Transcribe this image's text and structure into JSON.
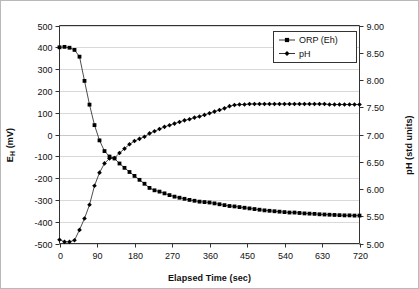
{
  "chart_data": {
    "type": "line",
    "title": "",
    "xlabel": "Elapsed Time (sec)",
    "ylabel": "EH (mV)",
    "y2label": "pH (std units)",
    "xlim": [
      0,
      720
    ],
    "ylim": [
      -500,
      500
    ],
    "y2lim": [
      5.0,
      9.0
    ],
    "xticks": [
      0,
      90,
      180,
      270,
      360,
      450,
      540,
      630,
      720
    ],
    "yticks": [
      -500,
      -400,
      -300,
      -200,
      -100,
      0,
      100,
      200,
      300,
      400,
      500
    ],
    "y2ticks": [
      5.0,
      5.5,
      6.0,
      6.5,
      7.0,
      7.5,
      8.0,
      8.5,
      9.0
    ],
    "xtick_labels": [
      "0",
      "90",
      "180",
      "270",
      "360",
      "450",
      "540",
      "630",
      "720"
    ],
    "ytick_labels": [
      "-500",
      "-400",
      "-300",
      "-200",
      "-100",
      "0",
      "100",
      "200",
      "300",
      "400",
      "500"
    ],
    "y2tick_labels": [
      "5.00",
      "5.50",
      "6.00",
      "6.50",
      "7.00",
      "7.50",
      "8.00",
      "8.50",
      "9.00"
    ],
    "grid": "horizontal-only",
    "legend_position": "top-right",
    "series": [
      {
        "name": "ORP (Eh)",
        "axis": "left",
        "marker": "square",
        "color": "#000000",
        "x": [
          0,
          12,
          24,
          36,
          48,
          60,
          72,
          84,
          96,
          108,
          120,
          132,
          144,
          156,
          168,
          180,
          192,
          204,
          216,
          228,
          240,
          252,
          264,
          276,
          288,
          300,
          312,
          324,
          336,
          348,
          360,
          372,
          384,
          396,
          408,
          420,
          432,
          444,
          456,
          468,
          480,
          492,
          504,
          516,
          528,
          540,
          552,
          564,
          576,
          588,
          600,
          612,
          624,
          636,
          648,
          660,
          672,
          684,
          696,
          708,
          720
        ],
        "values": [
          400,
          402,
          398,
          388,
          357,
          246,
          137,
          43,
          -27,
          -76,
          -101,
          -110,
          -133,
          -153,
          -172,
          -190,
          -208,
          -226,
          -245,
          -256,
          -262,
          -270,
          -278,
          -285,
          -290,
          -295,
          -300,
          -304,
          -308,
          -310,
          -312,
          -316,
          -320,
          -324,
          -328,
          -330,
          -333,
          -336,
          -339,
          -342,
          -345,
          -348,
          -350,
          -352,
          -354,
          -356,
          -358,
          -358,
          -360,
          -362,
          -363,
          -364,
          -366,
          -367,
          -368,
          -369,
          -370,
          -371,
          -371,
          -372,
          -372
        ]
      },
      {
        "name": "pH",
        "axis": "right",
        "marker": "diamond",
        "color": "#000000",
        "x": [
          0,
          12,
          24,
          36,
          48,
          60,
          72,
          84,
          96,
          108,
          120,
          132,
          144,
          156,
          168,
          180,
          192,
          204,
          216,
          228,
          240,
          252,
          264,
          276,
          288,
          300,
          312,
          324,
          336,
          348,
          360,
          372,
          384,
          396,
          408,
          420,
          432,
          444,
          456,
          468,
          480,
          492,
          504,
          516,
          528,
          540,
          552,
          564,
          576,
          588,
          600,
          612,
          624,
          636,
          648,
          660,
          672,
          684,
          696,
          708,
          720
        ],
        "values": [
          5.07,
          5.03,
          5.03,
          5.06,
          5.25,
          5.46,
          5.71,
          6.06,
          6.3,
          6.47,
          6.56,
          6.57,
          6.66,
          6.74,
          6.82,
          6.88,
          6.92,
          6.96,
          7.02,
          7.06,
          7.1,
          7.14,
          7.17,
          7.2,
          7.23,
          7.26,
          7.28,
          7.31,
          7.33,
          7.36,
          7.39,
          7.42,
          7.45,
          7.48,
          7.52,
          7.54,
          7.55,
          7.55,
          7.56,
          7.56,
          7.56,
          7.56,
          7.56,
          7.56,
          7.56,
          7.56,
          7.56,
          7.56,
          7.56,
          7.56,
          7.56,
          7.56,
          7.56,
          7.56,
          7.55,
          7.55,
          7.55,
          7.55,
          7.55,
          7.55,
          7.55
        ]
      }
    ]
  },
  "axes": {
    "x_title": "Elapsed Time (sec)",
    "y_left_title_main": "E",
    "y_left_title_sub": "H",
    "y_left_title_unit": " (mV)",
    "y_right_title": "pH (std units)"
  },
  "legend": {
    "items": [
      {
        "label": "ORP (Eh)",
        "marker": "square"
      },
      {
        "label": "pH",
        "marker": "diamond"
      }
    ]
  },
  "colors": {
    "series": "#000000",
    "grid": "#c8c8c8",
    "axis": "#333333",
    "frame": "#b9b9b9",
    "background": "#ffffff"
  }
}
